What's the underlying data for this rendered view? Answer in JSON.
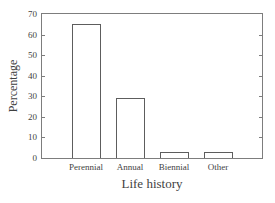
{
  "figure": {
    "background": "#ffffff",
    "ink_color": "#3f3f3f",
    "box_color": "#7d7d7d"
  },
  "chart_data": {
    "type": "bar",
    "categories": [
      "Perennial",
      "Annual",
      "Biennial",
      "Other"
    ],
    "values": [
      65,
      29,
      3,
      3
    ],
    "title": "",
    "xlabel": "Life history",
    "ylabel": "Percentage",
    "ylim": [
      0,
      70
    ],
    "yticks": [
      0,
      10,
      20,
      30,
      40,
      50,
      60,
      70
    ],
    "bar_fill": "#ffffff",
    "bar_border": "#5d5d5d",
    "grid": "off",
    "legend": "none",
    "tick_direction": "in",
    "plot_box": "full"
  }
}
